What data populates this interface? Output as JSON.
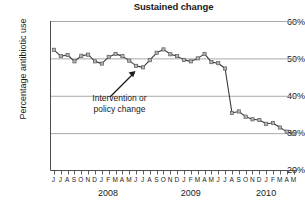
{
  "chart_data": {
    "type": "line",
    "title": "Sustained change",
    "xlabel": "",
    "ylabel": "Percentage antibiotic use",
    "ylim": [
      20,
      60
    ],
    "yticks": [
      "20%",
      "30%",
      "40%",
      "50%",
      "60%"
    ],
    "ytick_values": [
      20,
      30,
      40,
      50,
      60
    ],
    "grid": true,
    "legend": null,
    "x": [
      "J",
      "J",
      "A",
      "S",
      "O",
      "N",
      "D",
      "J",
      "F",
      "M",
      "A",
      "M",
      "J",
      "J",
      "A",
      "S",
      "O",
      "N",
      "D",
      "J",
      "F",
      "M",
      "A",
      "M",
      "J",
      "J",
      "A",
      "S",
      "O",
      "N",
      "D",
      "J",
      "F",
      "M",
      "A",
      "M"
    ],
    "x_month_labels": [
      "J",
      "J",
      "A",
      "S",
      "O",
      "N",
      "D",
      "J",
      "F",
      "M",
      "A",
      "M",
      "J",
      "J",
      "A",
      "S",
      "O",
      "N",
      "D",
      "J",
      "F",
      "M",
      "A",
      "M",
      "J",
      "J",
      "A",
      "S",
      "O",
      "N",
      "D",
      "J",
      "F",
      "M",
      "A",
      "M"
    ],
    "year_labels": [
      {
        "label": "2008",
        "position_fraction": 0.235
      },
      {
        "label": "2009",
        "position_fraction": 0.57
      },
      {
        "label": "2010",
        "position_fraction": 0.875
      }
    ],
    "series": [
      {
        "name": "Percentage antibiotic use",
        "values": [
          52.3,
          50.6,
          50.9,
          49.2,
          50.7,
          51.0,
          49.2,
          48.6,
          50.4,
          51.2,
          50.6,
          49.4,
          48.0,
          47.6,
          49.5,
          51.5,
          52.4,
          51.1,
          50.6,
          49.6,
          49.2,
          50.0,
          51.2,
          49.0,
          48.7,
          47.3,
          35.4,
          35.8,
          34.4,
          33.7,
          33.5,
          32.5,
          32.7,
          31.5,
          30.4,
          29.8
        ],
        "line_color": "#3a3a3a",
        "marker_color": "#9a9a9a",
        "marker": "square"
      }
    ],
    "annotations": [
      {
        "name": "intervention-annotation",
        "text_line1": "Intervention or",
        "text_line2": "policy change",
        "arrow": "up-right"
      }
    ],
    "colors": {
      "grid": "#a8a8a8",
      "axis": "#4d4d4d",
      "text": "#1a1a1a",
      "line": "#3a3a3a",
      "marker_fill": "#b3b3b3",
      "marker_edge": "#5a5a5a"
    }
  }
}
